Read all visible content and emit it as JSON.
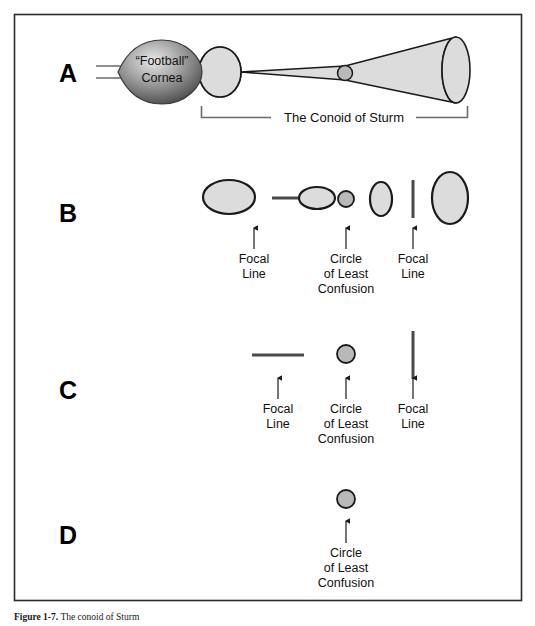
{
  "figure": {
    "title_label": "Figure 1-7.",
    "caption_text": "The conoid of Sturm",
    "border_color": "#2b2b2b",
    "fill_color": "#dcdcdc",
    "stroke_color": "#1a1a1a",
    "line_gray": "#6b6b6b",
    "cornea_dark": "#555555",
    "cornea_light": "#cfcfcf"
  },
  "rows": [
    {
      "id": "row-a",
      "label": "A",
      "label_x": 68,
      "label_y": 75,
      "cornea": {
        "label_line1": "“Football”",
        "label_line2": "Cornea",
        "cx": 160,
        "cy": 72,
        "rx": 42,
        "ry": 28
      },
      "rays": [
        {
          "x1": 96,
          "y1": 66,
          "x2": 150,
          "y2": 66
        },
        {
          "x1": 96,
          "y1": 78,
          "x2": 150,
          "y2": 78
        }
      ],
      "bracket": {
        "label": "The Conoid of Sturm",
        "x_start": 201,
        "x_end": 468,
        "y": 117,
        "tick_height": 11
      },
      "conoid": {
        "left_ellipse_cx": 220,
        "left_ellipse_cy": 72,
        "left_rx": 21,
        "left_ry": 25,
        "waist_cx": 345,
        "waist_cy": 73,
        "waist_r": 7,
        "right_ellipse_cx": 456,
        "right_ellipse_cy": 70,
        "right_rx": 14,
        "right_ry": 33
      }
    },
    {
      "id": "row-b",
      "label": "B",
      "label_x": 68,
      "label_y": 215,
      "shapes": [
        {
          "kind": "ellipse",
          "name": "blur-ellipse-horizontal-large",
          "cx": 229,
          "cy": 197,
          "rx": 26,
          "ry": 17
        },
        {
          "kind": "hline",
          "name": "focal-line-horizontal",
          "cx": 294,
          "cy": 198,
          "half": 22,
          "thickness": 3
        },
        {
          "kind": "ellipse",
          "name": "blur-ellipse-horizontal-small",
          "cx": 317,
          "cy": 198,
          "rx": 18,
          "ry": 11
        },
        {
          "kind": "circle",
          "name": "circle-of-least-confusion",
          "cx": 346,
          "cy": 199,
          "r": 8
        },
        {
          "kind": "ellipse",
          "name": "blur-ellipse-vertical-small",
          "cx": 381,
          "cy": 199,
          "rx": 11,
          "ry": 17
        },
        {
          "kind": "vline",
          "name": "focal-line-vertical",
          "cx": 413,
          "cy": 199,
          "half": 19,
          "thickness": 3
        },
        {
          "kind": "ellipse",
          "name": "blur-ellipse-vertical-large",
          "cx": 450,
          "cy": 198,
          "rx": 18,
          "ry": 26
        }
      ],
      "annotations": [
        {
          "name": "focal-line-left",
          "x": 254,
          "arrow_top": 228,
          "arrow_bottom": 249,
          "lines": [
            "Focal",
            "Line"
          ]
        },
        {
          "name": "circle-of-least-confusion",
          "x": 346,
          "arrow_top": 228,
          "arrow_bottom": 249,
          "lines": [
            "Circle",
            "of Least",
            "Confusion"
          ]
        },
        {
          "name": "focal-line-right",
          "x": 413,
          "arrow_top": 228,
          "arrow_bottom": 249,
          "lines": [
            "Focal",
            "Line"
          ]
        }
      ]
    },
    {
      "id": "row-c",
      "label": "C",
      "label_x": 68,
      "label_y": 392,
      "shapes": [
        {
          "kind": "hline",
          "name": "focal-line-horizontal",
          "cx": 278,
          "cy": 355,
          "half": 26,
          "thickness": 3
        },
        {
          "kind": "circle",
          "name": "circle-of-least-confusion",
          "cx": 346,
          "cy": 354,
          "r": 9
        },
        {
          "kind": "vline",
          "name": "focal-line-vertical",
          "cx": 413,
          "cy": 355,
          "half": 24,
          "thickness": 3
        }
      ],
      "annotations": [
        {
          "name": "focal-line-left",
          "x": 278,
          "arrow_top": 378,
          "arrow_bottom": 399,
          "lines": [
            "Focal",
            "Line"
          ]
        },
        {
          "name": "circle-of-least-confusion",
          "x": 346,
          "arrow_top": 378,
          "arrow_bottom": 399,
          "lines": [
            "Circle",
            "of Least",
            "Confusion"
          ]
        },
        {
          "name": "focal-line-right",
          "x": 413,
          "arrow_top": 378,
          "arrow_bottom": 399,
          "lines": [
            "Focal",
            "Line"
          ]
        }
      ]
    },
    {
      "id": "row-d",
      "label": "D",
      "label_x": 68,
      "label_y": 537,
      "shapes": [
        {
          "kind": "circle",
          "name": "circle-of-least-confusion",
          "cx": 346,
          "cy": 499,
          "r": 9
        }
      ],
      "annotations": [
        {
          "name": "circle-of-least-confusion",
          "x": 346,
          "arrow_top": 521,
          "arrow_bottom": 543,
          "lines": [
            "Circle",
            "of Least",
            "Confusion"
          ]
        }
      ]
    }
  ],
  "frame": {
    "x": 14,
    "y": 14,
    "width": 508,
    "height": 587
  }
}
